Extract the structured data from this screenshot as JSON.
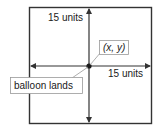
{
  "diagram": {
    "vertical_label": "15 units",
    "horizontal_label": "15 units",
    "point_label": "(x, y)",
    "callout_label": "balloon lands",
    "line_color": "#333333",
    "callout_border_color": "#999999"
  }
}
